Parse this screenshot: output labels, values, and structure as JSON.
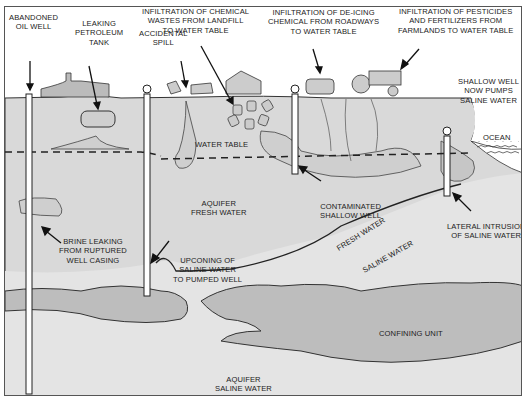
{
  "colors": {
    "aquifer_fresh": "#d9d9d9",
    "aquifer_saline": "#e4e4e4",
    "confining_unit": "#bdbdbd",
    "contamination_zone": "#cfcfcf",
    "ocean": "#ffffff",
    "outline": "#333333",
    "well_casing": "#ffffff"
  },
  "labels": {
    "abandoned_oil_well": [
      "ABANDONED",
      "OIL WELL"
    ],
    "leaking_petroleum_tank": [
      "LEAKING",
      "PETROLEUM",
      "TANK"
    ],
    "accidental_spill": [
      "ACCIDENTAL",
      "SPILL"
    ],
    "landfill": [
      "INFILTRATION OF CHEMICAL",
      "WASTES FROM LANDFILL",
      "TO WATER TABLE"
    ],
    "de_icing": [
      "INFILTRATION OF DE-ICING",
      "CHEMICAL FROM ROADWAYS",
      "TO WATER TABLE"
    ],
    "pesticides": [
      "INFILTRATION OF PESTICIDES",
      "AND FERTILIZERS FROM",
      "FARMLANDS TO WATER TABLE"
    ],
    "shallow_well_saline": [
      "SHALLOW WELL",
      "NOW PUMPS",
      "SALINE WATER"
    ],
    "ocean": "OCEAN",
    "water_table": "WATER TABLE",
    "aquifer_fresh": [
      "AQUIFER",
      "FRESH WATER"
    ],
    "contaminated_shallow_well": [
      "CONTAMINATED",
      "SHALLOW WELL"
    ],
    "brine_leaking": [
      "BRINE LEAKING",
      "FROM RUPTURED",
      "WELL CASING"
    ],
    "upconing": [
      "UPCONING OF",
      "SALINE WATER",
      "TO PUMPED WELL"
    ],
    "lateral_intrusion": [
      "LATERAL INTRUSION",
      "OF SALINE WATER"
    ],
    "fresh_water": "FRESH WATER",
    "saline_water": "SALINE WATER",
    "confining_unit": "CONFINING UNIT",
    "aquifer_saline": [
      "AQUIFER",
      "SALINE WATER"
    ]
  }
}
